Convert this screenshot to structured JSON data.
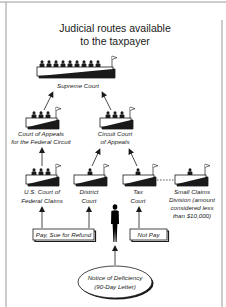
{
  "title": {
    "line1": "Judicial routes available",
    "line2": "to the taxpayer"
  },
  "courts": {
    "supreme": {
      "label": "Supreme Court",
      "judges": 9
    },
    "federal_circuit": {
      "line1": "Court of Appeals",
      "line2": "for the Federal Circuit",
      "judges": 3
    },
    "circuit": {
      "line1": "Circuit Court",
      "line2": "of Appeals",
      "judges": 3
    },
    "claims": {
      "line1": "U.S. Court of",
      "line2": "Federal Claims",
      "judges": 3
    },
    "district": {
      "line1": "District",
      "line2": "Court",
      "judges": 1
    },
    "tax": {
      "line1": "Tax",
      "line2": "Court",
      "judges": 1
    },
    "small_claims": {
      "line1": "Small Claims",
      "line2": "Division (amount",
      "line3": "considered less",
      "line4": "than $10,000)",
      "judges": 1
    }
  },
  "options": {
    "pay": "Pay, Sue for Refund",
    "not_pay": "Not Pay"
  },
  "notice": {
    "line1": "Notice of Deficiency",
    "line2": "(90-Day Letter)"
  },
  "icons": {
    "bench": "court-bench-icon",
    "flag": "flag-icon",
    "person": "taxpayer-silhouette-icon"
  },
  "colors": {
    "ink": "#1a1a1a",
    "frame": "#9a9a9a",
    "background": "#ffffff"
  }
}
